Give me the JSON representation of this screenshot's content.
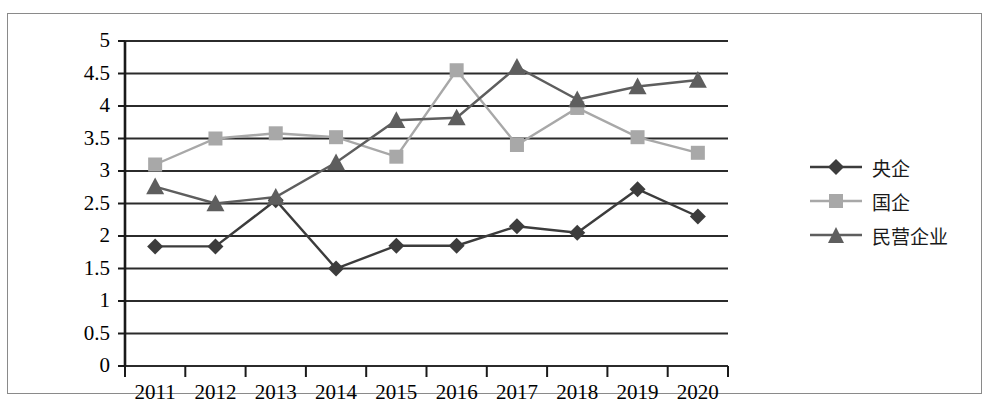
{
  "chart_data": {
    "type": "line",
    "title": "",
    "xlabel": "",
    "ylabel": "",
    "categories": [
      "2011",
      "2012",
      "2013",
      "2014",
      "2015",
      "2016",
      "2017",
      "2018",
      "2019",
      "2020"
    ],
    "ylim": [
      0,
      5
    ],
    "ytick_values": [
      "0",
      "0.5",
      "1",
      "1.5",
      "2",
      "2.5",
      "3",
      "3.5",
      "4",
      "4.5",
      "5"
    ],
    "grid": "horizontal",
    "legend_position": "right",
    "series": [
      {
        "name": "央企",
        "marker": "diamond",
        "color": "#3c3c3c",
        "values": [
          1.84,
          1.84,
          2.55,
          1.5,
          1.85,
          1.85,
          2.15,
          2.05,
          2.72,
          2.3
        ]
      },
      {
        "name": "国企",
        "marker": "square",
        "color": "#a8a8a8",
        "values": [
          3.1,
          3.5,
          3.58,
          3.52,
          3.22,
          4.55,
          3.4,
          3.97,
          3.52,
          3.28
        ]
      },
      {
        "name": "民营企业",
        "marker": "triangle",
        "color": "#5e5e5e",
        "values": [
          2.76,
          2.5,
          2.6,
          3.13,
          3.78,
          3.82,
          4.6,
          4.1,
          4.3,
          4.4
        ]
      }
    ]
  },
  "axis": {
    "y_axis_color": "#1a1a1a",
    "x_axis_color": "#1a1a1a",
    "gridline_color": "#2b2b2b"
  },
  "legend": {
    "items": [
      {
        "label": "央企"
      },
      {
        "label": "国企"
      },
      {
        "label": "民营企业"
      }
    ]
  }
}
